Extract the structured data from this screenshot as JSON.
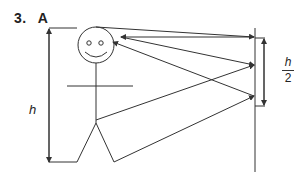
{
  "question": {
    "number": "3.",
    "answer_letter": "A"
  },
  "diagram": {
    "labels": {
      "height": "h",
      "mirror_height_numerator": "h",
      "mirror_height_denominator": "2"
    },
    "colors": {
      "line": "#333333",
      "background": "#ffffff"
    }
  }
}
